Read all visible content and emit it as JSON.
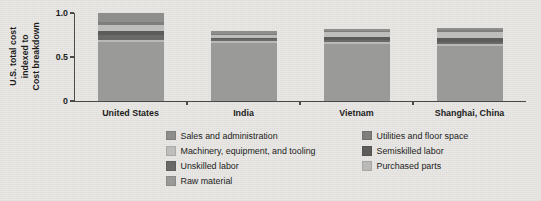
{
  "chart_data": {
    "type": "bar",
    "variant": "stacked-bar",
    "title": "",
    "subtitle": "",
    "xlabel": "",
    "ylabel": "Cost breakdown indexed to U.S. total cost",
    "ylabel_lines": [
      "Cost breakdown",
      "indexed to",
      "U.S. total cost"
    ],
    "categories": [
      "United States",
      "India",
      "Vietnam",
      "Shanghai, China"
    ],
    "ylim": [
      0,
      1.0
    ],
    "yticks": [
      0,
      0.5,
      1.0
    ],
    "ytick_labels": [
      "0",
      "0.5",
      "1.0"
    ],
    "grid": false,
    "legend_position": "bottom",
    "legend_columns": 2,
    "totals": [
      1.0,
      0.78,
      0.82,
      0.83
    ],
    "series": [
      {
        "name": "Raw material",
        "color": "#9a9a98",
        "values": [
          0.67,
          0.66,
          0.65,
          0.63
        ]
      },
      {
        "name": "Purchased parts",
        "color": "#b9b9b7",
        "values": [
          0.02,
          0.02,
          0.02,
          0.02
        ]
      },
      {
        "name": "Unskilled labor",
        "color": "#6a6a68",
        "values": [
          0.06,
          0.02,
          0.02,
          0.02
        ]
      },
      {
        "name": "Semiskilled labor",
        "color": "#5c5c5a",
        "values": [
          0.05,
          0.02,
          0.04,
          0.05
        ]
      },
      {
        "name": "Machinery, equipment, and tooling",
        "color": "#bdbdbb",
        "values": [
          0.06,
          0.03,
          0.05,
          0.06
        ]
      },
      {
        "name": "Utilities and floor space",
        "color": "#7e7e7c",
        "values": [
          0.04,
          0.015,
          0.015,
          0.025
        ]
      },
      {
        "name": "Sales and administration",
        "color": "#8e8e8c",
        "values": [
          0.1,
          0.025,
          0.025,
          0.025
        ]
      }
    ]
  },
  "legend": {
    "columns": [
      {
        "items": [
          {
            "label": "Sales and administration",
            "color": "#8e8e8c",
            "swatch": "legend-swatch"
          },
          {
            "label": "Machinery, equipment, and tooling",
            "color": "#bdbdbb",
            "swatch": "legend-swatch"
          },
          {
            "label": "Unskilled labor",
            "color": "#6a6a68",
            "swatch": "legend-swatch"
          },
          {
            "label": "Raw material",
            "color": "#9a9a98",
            "swatch": "legend-swatch"
          }
        ]
      },
      {
        "items": [
          {
            "label": "Utilities and floor space",
            "color": "#7e7e7c",
            "swatch": "legend-swatch"
          },
          {
            "label": "Semiskilled labor",
            "color": "#5c5c5a",
            "swatch": "legend-swatch"
          },
          {
            "label": "Purchased parts",
            "color": "#b9b9b7",
            "swatch": "legend-swatch"
          }
        ]
      }
    ]
  },
  "style": {
    "background": "#e9e8e5",
    "axis_color": "#4a4a48",
    "text_color": "#1d1d1b"
  }
}
